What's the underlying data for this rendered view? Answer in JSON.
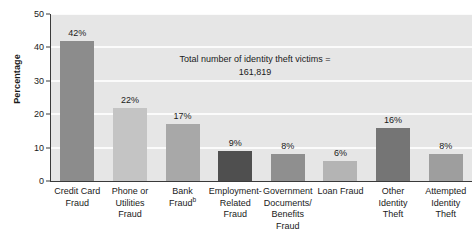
{
  "chart_data": {
    "type": "bar",
    "title": "",
    "xlabel": "",
    "ylabel": "Percentage",
    "ylim": [
      0,
      50
    ],
    "ytick_step": 10,
    "grid": true,
    "gridline_color": "#fbfbfb",
    "plot_background": "#e6e6e6",
    "legend": "none",
    "value_suffix": "%",
    "categories": [
      "Credit Card Fraud",
      "Phone or Utilities Fraud",
      "Bank Fraud",
      "Employment-Related Fraud",
      "Government Documents/ Benefits Fraud",
      "Loan Fraud",
      "Other Identity Theft",
      "Attempted Identity Theft"
    ],
    "values": [
      42,
      22,
      17,
      9,
      8,
      6,
      16,
      8
    ],
    "bar_colors": [
      "#8c8c8c",
      "#c4c4c4",
      "#a8a8a8",
      "#4f4f4f",
      "#8f8f8f",
      "#b4b4b4",
      "#757575",
      "#9e9e9e"
    ],
    "annotations": [
      "Total number of identity theft victims =",
      "161,819"
    ],
    "footnote_markers": {
      "Bank Fraud": "b"
    }
  },
  "axis": {
    "y_ticks": [
      "50",
      "40",
      "30",
      "20",
      "10",
      "0"
    ],
    "y_title": "Percentage"
  },
  "x_labels": [
    {
      "lines": [
        "Credit Card",
        "Fraud"
      ],
      "marker": ""
    },
    {
      "lines": [
        "Phone or",
        "Utilities",
        "Fraud"
      ],
      "marker": ""
    },
    {
      "lines": [
        "Bank",
        "Fraud"
      ],
      "marker": "b"
    },
    {
      "lines": [
        "Employment-",
        "Related",
        "Fraud"
      ],
      "marker": ""
    },
    {
      "lines": [
        "Government",
        "Documents/",
        "Benefits",
        "Fraud"
      ],
      "marker": ""
    },
    {
      "lines": [
        "Loan Fraud"
      ],
      "marker": ""
    },
    {
      "lines": [
        "Other",
        "Identity",
        "Theft"
      ],
      "marker": ""
    },
    {
      "lines": [
        "Attempted",
        "Identity",
        "Theft"
      ],
      "marker": ""
    }
  ],
  "bar_labels": [
    "42%",
    "22%",
    "17%",
    "9%",
    "8%",
    "6%",
    "16%",
    "8%"
  ]
}
